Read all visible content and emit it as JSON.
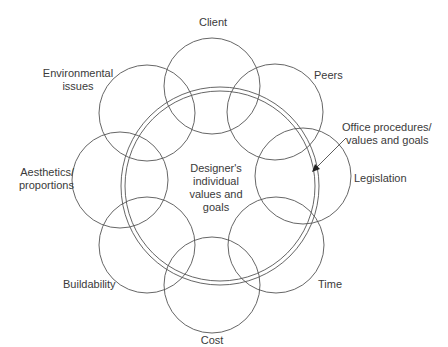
{
  "diagram": {
    "center": {
      "label_lines": [
        "Designer's",
        "individual",
        "values and",
        "goals"
      ]
    },
    "ring": {
      "label_lines": [
        "Office procedures/",
        "values and goals"
      ]
    },
    "nodes": [
      {
        "id": "client",
        "label_lines": [
          "Client"
        ]
      },
      {
        "id": "peers",
        "label_lines": [
          "Peers"
        ]
      },
      {
        "id": "legislation",
        "label_lines": [
          "Legislation"
        ]
      },
      {
        "id": "time",
        "label_lines": [
          "Time"
        ]
      },
      {
        "id": "cost",
        "label_lines": [
          "Cost"
        ]
      },
      {
        "id": "buildability",
        "label_lines": [
          "Buildability"
        ]
      },
      {
        "id": "aesthetics",
        "label_lines": [
          "Aesthetics/",
          "proportions"
        ]
      },
      {
        "id": "environmental",
        "label_lines": [
          "Environmental",
          "issues"
        ]
      }
    ],
    "colors": {
      "stroke": "#555555",
      "text": "#3a3a3a",
      "background": "#ffffff"
    }
  }
}
